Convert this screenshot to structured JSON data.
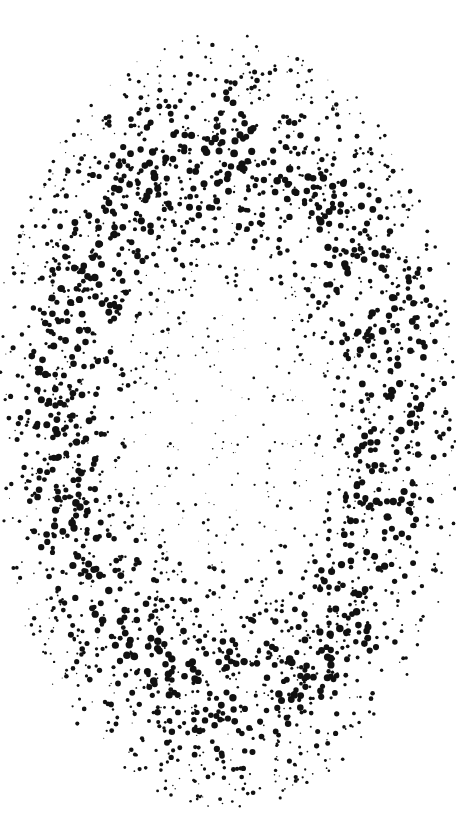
{
  "artwork": {
    "description": "Abstract radial dot pattern forming an oval, dense ring with sparse center",
    "background": "#ffffff",
    "dot_color": "#111111",
    "width": 456,
    "height": 813,
    "center": [
      228,
      420
    ],
    "radii": [
      230,
      370
    ],
    "seed": 7
  }
}
